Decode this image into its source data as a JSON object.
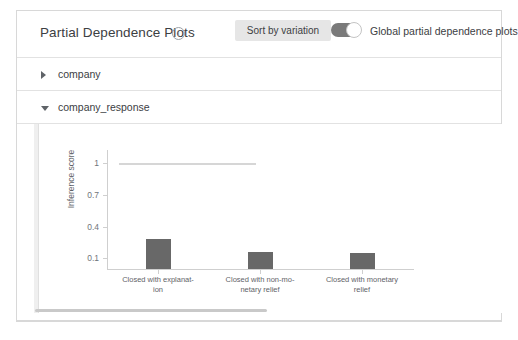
{
  "header": {
    "title": "Partial Dependence Plots",
    "info_icon": "info-icon",
    "sort_button_label": "Sort by variation",
    "toggle_label": "Global partial dependence plots",
    "toggle_state": "on",
    "accent_color": "#7a7a7a",
    "button_bg": "#e6e6e6"
  },
  "accordion": {
    "items": [
      {
        "label": "company",
        "expanded": "false",
        "caret": "caret-right-icon"
      },
      {
        "label": "company_response",
        "expanded": "true",
        "caret": "caret-down-icon"
      }
    ]
  },
  "chart_data": {
    "type": "bar",
    "title": "",
    "xlabel": "",
    "ylabel": "Inference score",
    "categories": [
      "Closed with explanat-\nion",
      "Closed with non-mo-\nnetary relief",
      "Closed with monetary\nrelief"
    ],
    "category_lines": [
      [
        "Closed with explanat-",
        "ion"
      ],
      [
        "Closed with non-mo-",
        "netary relief"
      ],
      [
        "Closed with monetary",
        "relief"
      ]
    ],
    "values": [
      0.28,
      0.16,
      0.15
    ],
    "ylim": [
      0.0,
      1.12
    ],
    "yticks": [
      1,
      0.7,
      0.4,
      0.1
    ],
    "ytick_labels": [
      "1",
      "0.7",
      "0.4",
      "0.1"
    ],
    "grid": "off",
    "legend": "none",
    "bar_color": "#686868",
    "reference_line": {
      "value": 1,
      "color": "#d6d6d6",
      "label": ""
    }
  }
}
